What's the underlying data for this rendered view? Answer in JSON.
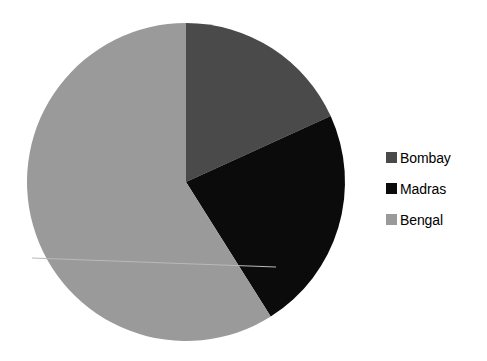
{
  "chart_data": {
    "type": "pie",
    "title": "",
    "categories": [
      "Bombay",
      "Madras",
      "Bengal"
    ],
    "values": [
      18.2,
      22.9,
      58.9
    ],
    "units": "percent",
    "start_angle_deg": 0,
    "direction": "clockwise",
    "slice_angles_deg": [
      65.5,
      82.3,
      212.2
    ],
    "slice_boundaries_deg": [
      0,
      65.5,
      147.8,
      360
    ],
    "colors": [
      "#4a4a4a",
      "#0b0b0b",
      "#9a9a9a"
    ],
    "legend_position": "right",
    "grid": false,
    "xlabel": "",
    "ylabel": "",
    "series": [
      {
        "name": "Presidencies",
        "points": [
          {
            "label": "Bombay",
            "value": 18.2,
            "color": "#4a4a4a"
          },
          {
            "label": "Madras",
            "value": 22.9,
            "color": "#0b0b0b"
          },
          {
            "label": "Bengal",
            "value": 58.9,
            "color": "#9a9a9a"
          }
        ]
      }
    ]
  },
  "pie": {
    "center_x": 186,
    "center_y": 182,
    "radius": 159,
    "slices": [
      {
        "name": "Bombay",
        "color": "#4a4a4a"
      },
      {
        "name": "Madras",
        "color": "#0b0b0b"
      },
      {
        "name": "Bengal",
        "color": "#9a9a9a"
      }
    ]
  },
  "legend": {
    "items": [
      {
        "label": "Bombay",
        "color": "#4a4a4a"
      },
      {
        "label": "Madras",
        "color": "#0b0b0b"
      },
      {
        "label": "Bengal",
        "color": "#9a9a9a"
      }
    ]
  },
  "canvas": {
    "background": "#ffffff",
    "width": 487,
    "height": 361
  }
}
